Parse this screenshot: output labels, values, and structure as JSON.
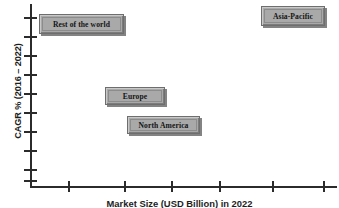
{
  "chart_data": {
    "type": "scatter",
    "title": "",
    "xlabel": "Market Size (USD Billion) in 2022",
    "ylabel": "CAGR % (2016 – 2022)",
    "grid": false,
    "legend": "none",
    "axis": {
      "x_ticks_count": 6,
      "x_tick_positions_px": [
        68,
        124,
        171,
        219,
        272,
        323
      ],
      "y_ticks_count": 10,
      "y_tick_positions_px": [
        17,
        36,
        55,
        74,
        93,
        112,
        131,
        150,
        169,
        180
      ],
      "x_tick_labels": [],
      "y_tick_labels": []
    },
    "points": [
      {
        "label": "Rest of the world",
        "x_px": 39,
        "y_px": 14,
        "w_px": 85,
        "h_px": 20,
        "market_size_rank": 1,
        "cagr_rank": 4
      },
      {
        "label": "Asia-Pacific",
        "x_px": 261,
        "y_px": 6,
        "w_px": 64,
        "h_px": 20,
        "market_size_rank": 4,
        "cagr_rank": 4
      },
      {
        "label": "Europe",
        "x_px": 105,
        "y_px": 87,
        "w_px": 60,
        "h_px": 18,
        "market_size_rank": 2,
        "cagr_rank": 2
      },
      {
        "label": "North America",
        "x_px": 127,
        "y_px": 116,
        "w_px": 73,
        "h_px": 18,
        "market_size_rank": 3,
        "cagr_rank": 1
      }
    ],
    "colors": {
      "box_fill": "#a9a9a9",
      "box_border": "#6e6e6e",
      "axis": "#2b2b2b",
      "text": "#141414",
      "background": "#ffffff"
    }
  }
}
